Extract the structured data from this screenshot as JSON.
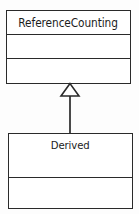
{
  "diagram": {
    "type": "uml-class-diagram",
    "relationship": "generalization",
    "background_color": "#fdfdfd",
    "line_color": "#2a2a2a",
    "classes": [
      {
        "id": "base",
        "name": "ReferenceCounting",
        "role": "superclass",
        "attributes": [],
        "operations": [],
        "bounds": {
          "x": 6,
          "y": 10,
          "width": 125,
          "height": 74
        }
      },
      {
        "id": "derived",
        "name": "Derived",
        "role": "subclass",
        "attributes": [],
        "operations": [],
        "bounds": {
          "x": 8,
          "y": 133,
          "width": 125,
          "height": 76
        }
      }
    ],
    "connector": {
      "name": "generalization-arrow",
      "arrowhead": "hollow-triangle",
      "from": "Derived",
      "to": "ReferenceCounting",
      "line_x": 70,
      "line_top_y": 95,
      "line_bottom_y": 133,
      "triangle": {
        "apex_x": 70,
        "apex_y": 83,
        "half_width": 9,
        "base_y": 96
      }
    }
  }
}
